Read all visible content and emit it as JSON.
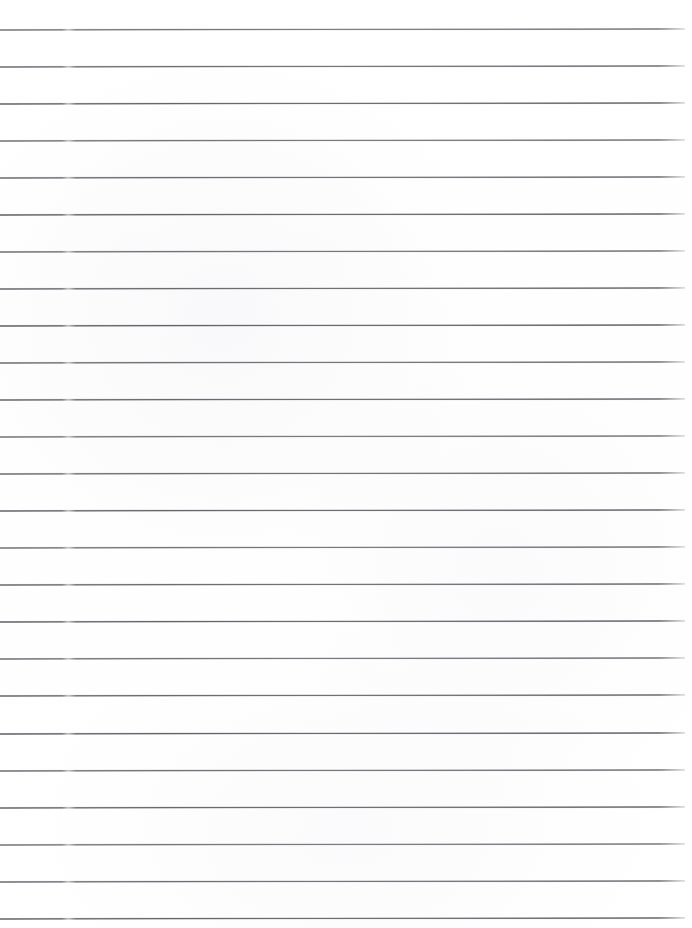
{
  "document": {
    "kind": "scanned-ruled-paper",
    "title": "Ruled Notebook Paper",
    "page_width": 692,
    "page_height": 928,
    "background_color": "#ffffff",
    "has_text": false,
    "has_margin_rule": false,
    "orientation": "portrait"
  },
  "ruling": {
    "line_color": "#5a5c62",
    "line_thickness_px": 1,
    "line_count": 25,
    "first_line_y": 29,
    "line_spacing_px": 37.05,
    "line_start_x": 0,
    "line_end_x": 685,
    "slant_deg": -0.09,
    "gutter_break_x": 62,
    "gutter_break_width": 14,
    "top_margin_px": 29,
    "bottom_margin_px": 10,
    "line_y_positions": [
      29,
      66.1,
      103.1,
      140.2,
      177.2,
      214.3,
      251.3,
      288.4,
      325.4,
      362.5,
      399.5,
      436.6,
      473.6,
      510.7,
      547.7,
      584.8,
      621.8,
      658.9,
      695.9,
      733.0,
      770.0,
      807.1,
      844.1,
      881.2,
      918.2
    ]
  }
}
